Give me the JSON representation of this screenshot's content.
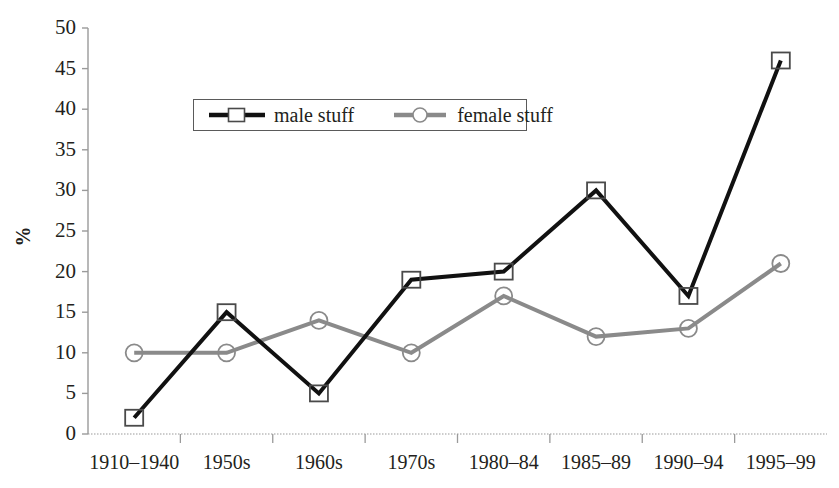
{
  "chart_data": {
    "type": "line",
    "title": "",
    "xlabel": "",
    "ylabel": "%",
    "categories": [
      "1910–1940",
      "1950s",
      "1960s",
      "1970s",
      "1980–84",
      "1985–89",
      "1990–94",
      "1995–99"
    ],
    "series": [
      {
        "name": "male stuff",
        "values": [
          2,
          15,
          5,
          19,
          20,
          30,
          17,
          46
        ],
        "color": "#111111",
        "marker": "square",
        "line_width": 4
      },
      {
        "name": "female stuff",
        "values": [
          10,
          10,
          14,
          10,
          17,
          12,
          13,
          21
        ],
        "color": "#8a8a8a",
        "marker": "circle",
        "line_width": 4
      }
    ],
    "ylim": [
      0,
      50
    ],
    "ytick_values": [
      0,
      5,
      10,
      15,
      20,
      25,
      30,
      35,
      40,
      45,
      50
    ],
    "ytick_labels": [
      "0",
      "5",
      "10",
      "15",
      "20",
      "25",
      "30",
      "35",
      "40",
      "45",
      "50"
    ],
    "grid": false,
    "legend_position": "upper-left-inside",
    "axis_color": "#9a9a9a"
  },
  "legend": {
    "entries": [
      {
        "label": "male stuff"
      },
      {
        "label": "female stuff"
      }
    ]
  },
  "axes": {
    "y_title": "%"
  }
}
